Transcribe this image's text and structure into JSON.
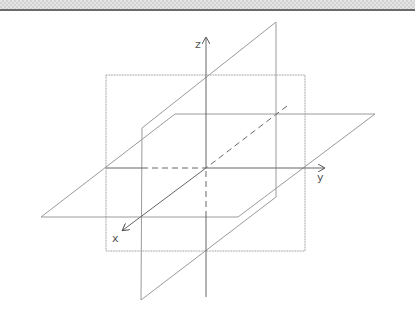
{
  "diagram": {
    "axes": {
      "x": {
        "label": "x"
      },
      "y": {
        "label": "y"
      },
      "z": {
        "label": "z"
      }
    },
    "planes": [
      {
        "name": "xz-plane",
        "shape": "rectangle"
      },
      {
        "name": "xy-plane",
        "shape": "parallelogram"
      },
      {
        "name": "slanted-plane",
        "shape": "parallelogram"
      }
    ],
    "colors": {
      "plane_stroke": "#9a9a9a",
      "axis_stroke": "#666666",
      "label": "#555555",
      "header_rule": "#6a6a6a"
    }
  }
}
